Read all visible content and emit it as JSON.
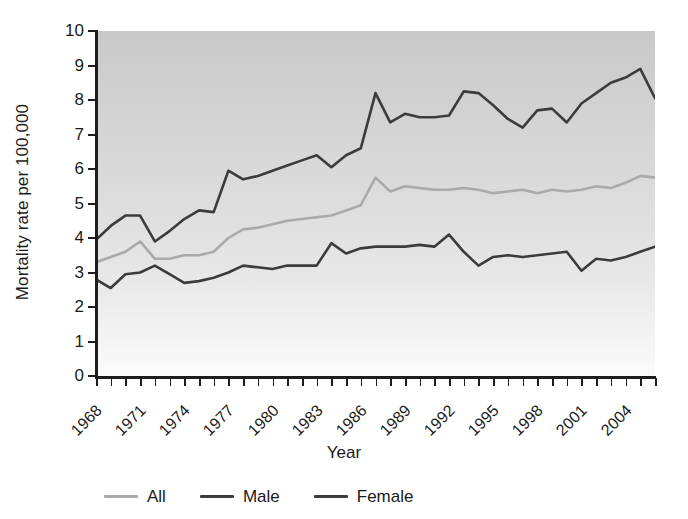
{
  "chart_data": {
    "type": "line",
    "title": "",
    "xlabel": "Year",
    "ylabel": "Mortality rate per 100,000",
    "xlim": [
      1968,
      2006
    ],
    "ylim": [
      0,
      10
    ],
    "ytick_labels": [
      "10",
      "9",
      "8",
      "7",
      "6",
      "5",
      "4",
      "3",
      "2",
      "1",
      "0"
    ],
    "ytick_values": [
      10,
      9,
      8,
      7,
      6,
      5,
      4,
      3,
      2,
      1,
      0
    ],
    "xtick_labels": [
      "1968",
      "1971",
      "1974",
      "1977",
      "1980",
      "1983",
      "1986",
      "1989",
      "1992",
      "1995",
      "1998",
      "2001",
      "2004"
    ],
    "xtick_values": [
      1968,
      1971,
      1974,
      1977,
      1980,
      1983,
      1986,
      1989,
      1992,
      1995,
      1998,
      2001,
      2004
    ],
    "grid": false,
    "legend_position": "below",
    "x": [
      1968,
      1969,
      1970,
      1971,
      1972,
      1973,
      1974,
      1975,
      1976,
      1977,
      1978,
      1979,
      1980,
      1981,
      1982,
      1983,
      1984,
      1985,
      1986,
      1987,
      1988,
      1989,
      1990,
      1991,
      1992,
      1993,
      1994,
      1995,
      1996,
      1997,
      1998,
      1999,
      2000,
      2001,
      2002,
      2003,
      2004,
      2005,
      2006
    ],
    "series": [
      {
        "name": "All",
        "color": "#aaaaaa",
        "values": [
          3.3,
          3.45,
          3.6,
          3.9,
          3.4,
          3.4,
          3.5,
          3.5,
          3.6,
          4.0,
          4.25,
          4.3,
          4.4,
          4.5,
          4.55,
          4.6,
          4.65,
          4.8,
          4.95,
          5.75,
          5.35,
          5.5,
          5.45,
          5.4,
          5.4,
          5.45,
          5.4,
          5.3,
          5.35,
          5.4,
          5.3,
          5.4,
          5.35,
          5.4,
          5.5,
          5.45,
          5.6,
          5.8,
          5.75
        ]
      },
      {
        "name": "Male",
        "color": "#3c3c3c",
        "values": [
          3.95,
          4.35,
          4.65,
          4.65,
          3.9,
          4.2,
          4.55,
          4.8,
          4.75,
          5.95,
          5.7,
          5.8,
          5.95,
          6.1,
          6.25,
          6.4,
          6.05,
          6.4,
          6.6,
          8.2,
          7.35,
          7.6,
          7.5,
          7.5,
          7.55,
          8.25,
          8.2,
          7.85,
          7.45,
          7.2,
          7.7,
          7.75,
          7.35,
          7.9,
          8.2,
          8.5,
          8.65,
          8.9,
          8.05
        ]
      },
      {
        "name": "Female",
        "color": "#3c3c3c",
        "values": [
          2.8,
          2.55,
          2.95,
          3.0,
          3.2,
          2.95,
          2.7,
          2.75,
          2.85,
          3.0,
          3.2,
          3.15,
          3.1,
          3.2,
          3.2,
          3.2,
          3.85,
          3.55,
          3.7,
          3.75,
          3.75,
          3.75,
          3.8,
          3.75,
          4.1,
          3.6,
          3.2,
          3.45,
          3.5,
          3.45,
          3.5,
          3.55,
          3.6,
          3.05,
          3.4,
          3.35,
          3.45,
          3.6,
          3.75
        ]
      }
    ]
  },
  "legend": {
    "items": [
      {
        "label": "All",
        "color": "#aaaaaa"
      },
      {
        "label": "Male",
        "color": "#3c3c3c"
      },
      {
        "label": "Female",
        "color": "#3c3c3c"
      }
    ]
  }
}
